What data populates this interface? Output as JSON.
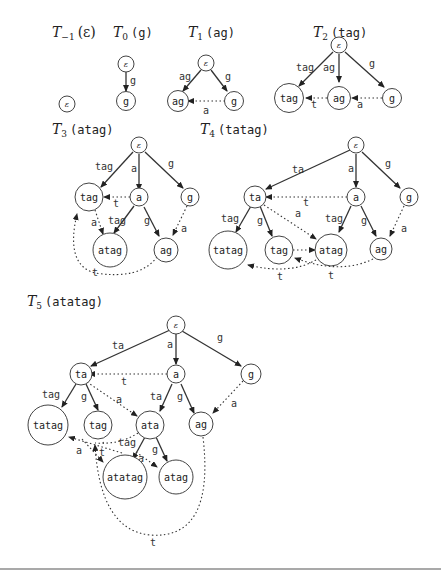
{
  "diagram": {
    "titles": {
      "t_minus1": {
        "sym": "T",
        "sub": "−1",
        "arg": "(ε)"
      },
      "t0": {
        "sym": "T",
        "sub": "0",
        "arg": "(g)"
      },
      "t1": {
        "sym": "T",
        "sub": "1",
        "arg": "(ag)"
      },
      "t2": {
        "sym": "T",
        "sub": "2",
        "arg": "(tag)"
      },
      "t3": {
        "sym": "T",
        "sub": "3",
        "arg": "(atag)"
      },
      "t4": {
        "sym": "T",
        "sub": "4",
        "arg": "(tatag)"
      },
      "t5": {
        "sym": "T",
        "sub": "5",
        "arg": "(atatag)"
      }
    },
    "eps": "ε",
    "trees": {
      "t0": {
        "nodes": [
          "ε",
          "g"
        ],
        "edges": [
          "g"
        ]
      },
      "t1": {
        "nodes": [
          "ε",
          "ag",
          "g"
        ],
        "edges": [
          "ag",
          "g"
        ],
        "suffix_links": [
          "a"
        ]
      },
      "t2": {
        "nodes": [
          "ε",
          "tag",
          "ag",
          "g"
        ],
        "edges": [
          "tag",
          "ag",
          "g"
        ],
        "suffix_links": [
          "t",
          "a"
        ]
      },
      "t3": {
        "nodes": [
          "ε",
          "tag",
          "a",
          "g",
          "atag",
          "ag"
        ],
        "edges": [
          "tag",
          "a",
          "g",
          "tag",
          "g"
        ],
        "suffix_links": [
          "t",
          "a",
          "a",
          "t"
        ]
      },
      "t4": {
        "nodes": [
          "ε",
          "ta",
          "a",
          "g",
          "tatag",
          "tag",
          "atag",
          "ag"
        ],
        "edges": [
          "ta",
          "a",
          "g",
          "tag",
          "g",
          "tag",
          "g"
        ],
        "suffix_links": [
          "t",
          "a",
          "a",
          "t",
          "t"
        ]
      },
      "t5": {
        "nodes": [
          "ε",
          "ta",
          "a",
          "g",
          "tatag",
          "tag",
          "ata",
          "ag",
          "atatag",
          "atag"
        ],
        "edges": [
          "ta",
          "a",
          "g",
          "tag",
          "g",
          "ta",
          "g",
          "tag",
          "g"
        ],
        "suffix_links": [
          "t",
          "a",
          "a",
          "tag",
          "a",
          "t",
          "a",
          "t"
        ]
      }
    }
  }
}
